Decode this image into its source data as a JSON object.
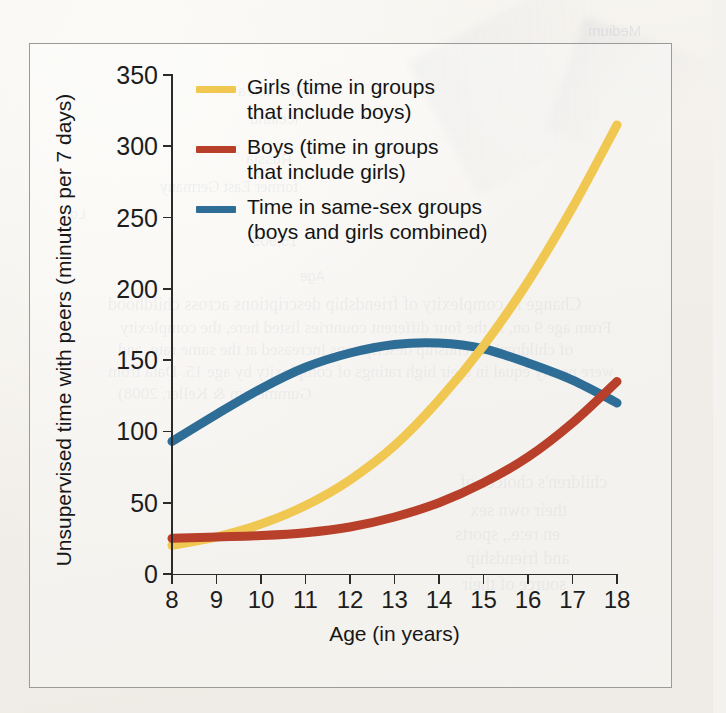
{
  "figure": {
    "frame_color": "#9a9a98",
    "page_background": "#f4f2ee"
  },
  "axes": {
    "x_title": "Age (in years)",
    "y_title": "Unsupervised time with peers (minutes per 7 days)",
    "x_ticks": [
      "8",
      "9",
      "10",
      "11",
      "12",
      "13",
      "14",
      "15",
      "16",
      "17",
      "18"
    ],
    "y_ticks": [
      "0",
      "50",
      "100",
      "150",
      "200",
      "250",
      "300",
      "350"
    ]
  },
  "legend": {
    "items": [
      {
        "label": "Girls (time in groups\nthat include boys)",
        "color": "#f0c851",
        "name": "girls"
      },
      {
        "label": "Boys (time in groups\nthat include girls)",
        "color": "#b8402a",
        "name": "boys"
      },
      {
        "label": "Time in same-sex groups\n(boys and girls combined)",
        "color": "#2e6d96",
        "name": "same-sex"
      }
    ]
  },
  "bleed_through": [
    {
      "text": "Medium",
      "x": 588,
      "y": 22,
      "size": 15,
      "serif": false
    },
    {
      "text": "New Guinea",
      "x": 238,
      "y": 82,
      "size": 15,
      "serif": false
    },
    {
      "text": "Iceland",
      "x": 250,
      "y": 110,
      "size": 15,
      "serif": false
    },
    {
      "text": "Russia",
      "x": 246,
      "y": 150,
      "size": 15,
      "serif": false
    },
    {
      "text": "former East Germany",
      "x": 160,
      "y": 178,
      "size": 16,
      "serif": true
    },
    {
      "text": "15,909",
      "x": 252,
      "y": 232,
      "size": 15,
      "serif": false
    },
    {
      "text": "Age",
      "x": 300,
      "y": 268,
      "size": 14,
      "serif": false
    },
    {
      "text": "Change in complexity of friendship descriptions across childhood",
      "x": 108,
      "y": 294,
      "size": 18,
      "serif": true
    },
    {
      "text": "From age 9 on, in the four different countries listed here, the complexity",
      "x": 120,
      "y": 318,
      "size": 17,
      "serif": true
    },
    {
      "text": "of children's friendship descriptions increased at the same rate, and",
      "x": 118,
      "y": 340,
      "size": 17,
      "serif": true
    },
    {
      "text": "were nearly equal in their high ratings of complexity by age 15.  Data from",
      "x": 108,
      "y": 362,
      "size": 17,
      "serif": true
    },
    {
      "text": "Gummerum & Keller, 2008)",
      "x": 118,
      "y": 384,
      "size": 17,
      "serif": true
    },
    {
      "text": "children's choices of",
      "x": 460,
      "y": 472,
      "size": 18,
      "serif": true
    },
    {
      "text": "their own sex",
      "x": 470,
      "y": 500,
      "size": 18,
      "serif": true
    },
    {
      "text": "en re:e., sports",
      "x": 455,
      "y": 524,
      "size": 18,
      "serif": true
    },
    {
      "text": "and friendship",
      "x": 466,
      "y": 548,
      "size": 18,
      "serif": true
    },
    {
      "text": "source of their",
      "x": 462,
      "y": 574,
      "size": 18,
      "serif": true
    },
    {
      "text": "Low",
      "x": 60,
      "y": 206,
      "size": 14,
      "serif": false
    }
  ],
  "chart_data": {
    "type": "line",
    "title": "",
    "xlabel": "Age (in years)",
    "ylabel": "Unsupervised time with peers (minutes per 7 days)",
    "xlim": [
      8,
      18
    ],
    "ylim": [
      0,
      350
    ],
    "grid": false,
    "legend_position": "top-left-inside",
    "x": [
      8,
      9,
      10,
      11,
      12,
      13,
      14,
      15,
      16,
      17,
      18
    ],
    "series": [
      {
        "name": "Girls (time in groups that include boys)",
        "color": "#f0c851",
        "values": [
          20,
          26,
          35,
          48,
          66,
          90,
          122,
          160,
          205,
          257,
          315
        ]
      },
      {
        "name": "Boys (time in groups that include girls)",
        "color": "#b8402a",
        "values": [
          25,
          26,
          27,
          29,
          33,
          40,
          50,
          64,
          82,
          106,
          135
        ]
      },
      {
        "name": "Time in same-sex groups (boys and girls combined)",
        "color": "#2e6d96",
        "values": [
          93,
          112,
          130,
          145,
          155,
          161,
          162,
          158,
          148,
          136,
          120
        ]
      }
    ],
    "annotations": [
      {
        "text": "girls curve crosses same-sex curve near age 15.3 at about 155 minutes"
      },
      {
        "text": "boys curve crosses same-sex curve near age 17.4 at about 122 minutes"
      },
      {
        "text": "same-sex curve peaks near age 13.7 at about 162 minutes"
      }
    ]
  }
}
